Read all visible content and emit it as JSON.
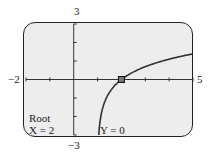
{
  "chart_data": {
    "type": "line",
    "title": "",
    "xlabel": "",
    "ylabel": "",
    "xlim": [
      -2,
      5
    ],
    "ylim": [
      -3,
      3
    ],
    "x_tick_step": 1,
    "y_tick_step": 1,
    "grid": false,
    "window_labels": {
      "xmin": "−2",
      "xmax": "5",
      "ymax": "3",
      "ymin": "−3"
    },
    "series": [
      {
        "name": "y = ln(x − 1)",
        "x": [
          1.05,
          1.1,
          1.2,
          1.35,
          1.5,
          1.75,
          2,
          2.5,
          3,
          3.5,
          4,
          4.5,
          5
        ],
        "values": [
          -3.0,
          -2.3,
          -1.61,
          -1.05,
          -0.69,
          -0.29,
          0,
          0.41,
          0.69,
          0.92,
          1.1,
          1.25,
          1.39
        ]
      }
    ],
    "annotations": [
      {
        "type": "marker",
        "x": 2,
        "y": 0,
        "shape": "square"
      }
    ]
  },
  "calculator": {
    "mode_label": "Root",
    "x_readout": "X = 2",
    "y_readout": "Y = 0"
  }
}
